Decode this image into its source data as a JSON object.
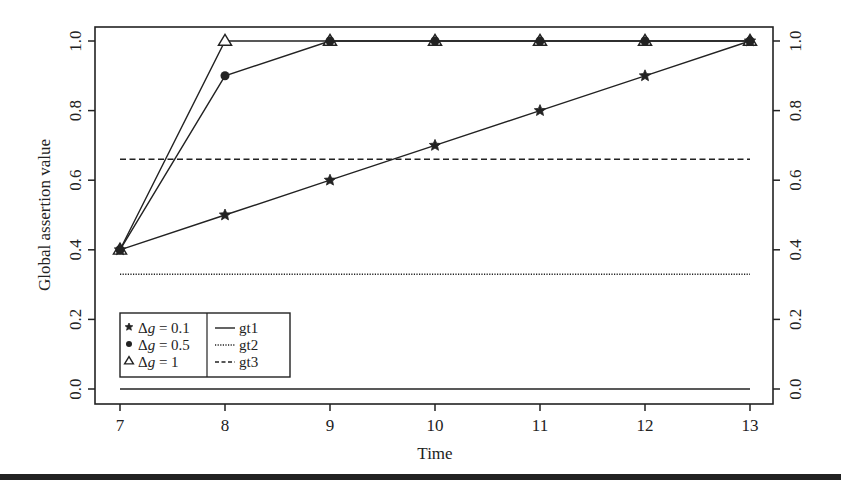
{
  "chart_data": {
    "type": "line",
    "title": "",
    "xlabel": "Time",
    "ylabel": "Global assertion value",
    "xlim": [
      7,
      13
    ],
    "ylim": [
      0.0,
      1.0
    ],
    "x_ticks": [
      "7",
      "8",
      "9",
      "10",
      "11",
      "12",
      "13"
    ],
    "y_ticks": [
      "0.0",
      "0.2",
      "0.4",
      "0.6",
      "0.8",
      "1.0"
    ],
    "y_ticks_right": [
      "0.0",
      "0.2",
      "0.4",
      "0.6",
      "0.8",
      "1.0"
    ],
    "grid": false,
    "legend_position": "lower-left",
    "x": [
      7,
      8,
      9,
      10,
      11,
      12,
      13
    ],
    "series": [
      {
        "name": "Δg = 0.1",
        "marker": "star",
        "line": "solid",
        "values": [
          0.4,
          0.5,
          0.6,
          0.7,
          0.8,
          0.9,
          1.0
        ]
      },
      {
        "name": "Δg = 0.5",
        "marker": "filled-circle",
        "line": "solid",
        "values": [
          0.4,
          0.9,
          1.0,
          1.0,
          1.0,
          1.0,
          1.0
        ]
      },
      {
        "name": "Δg = 1",
        "marker": "open-triangle",
        "line": "solid",
        "values": [
          0.4,
          1.0,
          1.0,
          1.0,
          1.0,
          1.0,
          1.0
        ]
      },
      {
        "name": "gt1",
        "marker": "none",
        "line": "solid",
        "values": [
          0.0,
          0.0,
          0.0,
          0.0,
          0.0,
          0.0,
          0.0
        ]
      },
      {
        "name": "gt2",
        "marker": "none",
        "line": "dotted",
        "values": [
          0.33,
          0.33,
          0.33,
          0.33,
          0.33,
          0.33,
          0.33
        ]
      },
      {
        "name": "gt3",
        "marker": "none",
        "line": "dashed",
        "values": [
          0.66,
          0.66,
          0.66,
          0.66,
          0.66,
          0.66,
          0.66
        ]
      }
    ],
    "legend": {
      "left": [
        {
          "marker": "star",
          "label_prefix": "Δ",
          "label_var": "g",
          "label_suffix": " = 0.1"
        },
        {
          "marker": "filled-circle",
          "label_prefix": "Δ",
          "label_var": "g",
          "label_suffix": " = 0.5"
        },
        {
          "marker": "open-triangle",
          "label_prefix": "Δ",
          "label_var": "g",
          "label_suffix": " = 1"
        }
      ],
      "right": [
        {
          "line": "solid",
          "label": "gt1"
        },
        {
          "line": "dotted",
          "label": "gt2"
        },
        {
          "line": "dashed",
          "label": "gt3"
        }
      ]
    }
  },
  "colors": {
    "ink": "#222222",
    "background": "#ffffff"
  }
}
